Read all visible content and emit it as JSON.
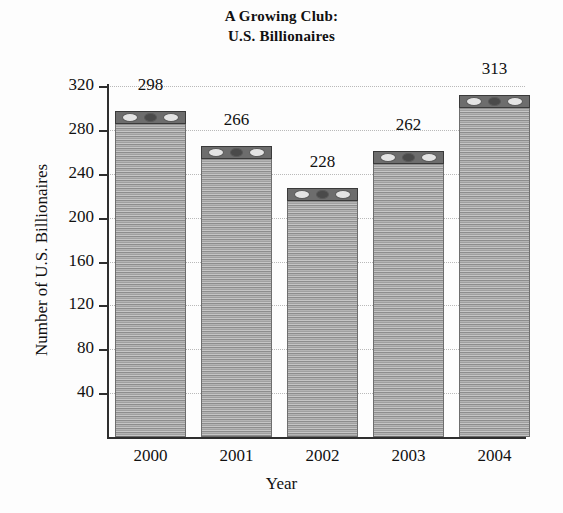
{
  "chart_data": {
    "type": "bar",
    "title": "A Growing Club: U.S. Billionaires",
    "title_lines": [
      "A Growing Club:",
      "U.S. Billionaires"
    ],
    "categories": [
      "2000",
      "2001",
      "2002",
      "2003",
      "2004"
    ],
    "values": [
      298,
      266,
      228,
      262,
      313
    ],
    "xlabel": "Year",
    "ylabel": "Number of U.S. Billionaires",
    "ylim": [
      0,
      320
    ],
    "yticks": [
      40,
      80,
      120,
      160,
      200,
      240,
      280,
      320
    ],
    "ytick_labels": [
      "40",
      "80",
      "120",
      "160",
      "200",
      "240",
      "280",
      "320"
    ],
    "value_labels": [
      "298",
      "266",
      "228",
      "262",
      "313"
    ],
    "grid": "horizontal-dotted",
    "legend": "none",
    "bar_style": "stacked-dollar-bills",
    "colors": {
      "bar_fill": "#9a9a9a",
      "bar_stripe_light": "#c6c6c6",
      "bar_stripe_dark": "#8d8d8d",
      "bar_border": "#6e6e6e",
      "bar_cap": "#6d6d6d",
      "axis": "#2e2e2e",
      "gridline": "#b9b9b9",
      "text": "#111111",
      "background": "#fdfdfd"
    }
  }
}
